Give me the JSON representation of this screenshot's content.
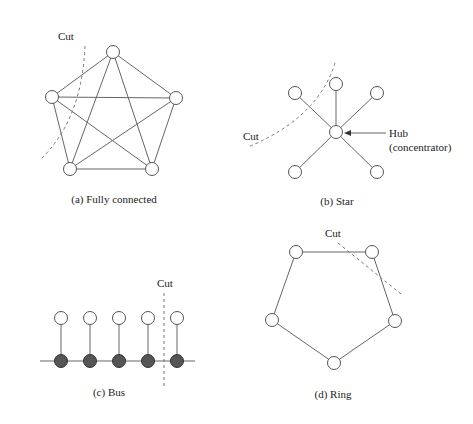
{
  "colors": {
    "edge": "#666666",
    "node_fill": "#ffffff",
    "bus_node_fill": "#555555",
    "cut": "#777777"
  },
  "panels": {
    "fully_connected": {
      "caption": "(a) Fully connected",
      "cut_label": "Cut",
      "nodes": [
        [
          113,
          52
        ],
        [
          52,
          97
        ],
        [
          176,
          98
        ],
        [
          70,
          169
        ],
        [
          152,
          169
        ]
      ]
    },
    "star": {
      "caption": "(b) Star",
      "cut_label": "Cut",
      "hub_label": "Hub",
      "hub_sublabel": "(concentrator)",
      "hub": [
        336,
        132
      ],
      "nodes": [
        [
          336,
          84
        ],
        [
          295,
          93
        ],
        [
          377,
          93
        ],
        [
          295,
          172
        ],
        [
          377,
          172
        ]
      ]
    },
    "bus": {
      "caption": "(c) Bus",
      "cut_label": "Cut",
      "station_x": [
        61,
        90,
        119,
        148,
        177
      ]
    },
    "ring": {
      "caption": "(d) Ring",
      "cut_label": "Cut",
      "nodes": [
        [
          296,
          252
        ],
        [
          372,
          252
        ],
        [
          395,
          321
        ],
        [
          334,
          363
        ],
        [
          272,
          320
        ]
      ]
    }
  }
}
